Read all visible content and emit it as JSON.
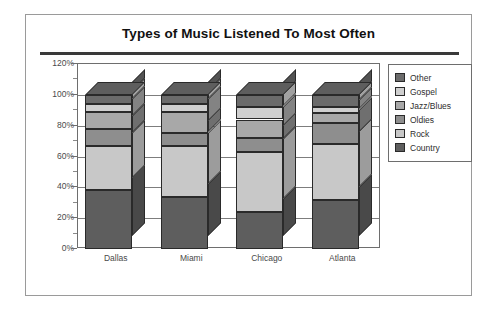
{
  "chart_data": {
    "type": "bar",
    "subtype": "stacked-column-100-3d",
    "title": "Types of Music Listened To Most Often",
    "xlabel": "",
    "ylabel": "",
    "ylim": [
      0,
      120
    ],
    "ytick_labels": [
      "0%",
      "20%",
      "40%",
      "60%",
      "80%",
      "100%",
      "120%"
    ],
    "ytick_values": [
      0,
      20,
      40,
      60,
      80,
      100,
      120
    ],
    "minor_tick_interval": 10,
    "grid": true,
    "legend_position": "right",
    "categories": [
      "Dallas",
      "Miami",
      "Chicago",
      "Atlanta"
    ],
    "series": [
      {
        "name": "Country",
        "color": "#5e5e5e",
        "values": [
          38,
          34,
          24,
          32
        ]
      },
      {
        "name": "Rock",
        "color": "#c8c8c8",
        "values": [
          29,
          33,
          39,
          36
        ]
      },
      {
        "name": "Oldies",
        "color": "#8e8e8e",
        "values": [
          11,
          8,
          9,
          14
        ]
      },
      {
        "name": "Jazz/Blues",
        "color": "#a8a8a8",
        "values": [
          11,
          14,
          12,
          6
        ]
      },
      {
        "name": "Gospel",
        "color": "#cfcfcf",
        "values": [
          5,
          5,
          8,
          4
        ]
      },
      {
        "name": "Other",
        "color": "#6b6b6b",
        "values": [
          6,
          6,
          8,
          8
        ]
      }
    ],
    "legend_order": [
      "Other",
      "Gospel",
      "Jazz/Blues",
      "Oldies",
      "Rock",
      "Country"
    ]
  },
  "colors": {
    "frame": "#9a9a9a",
    "title_rule": "#3a3a3a",
    "axis": "#6e6e6e",
    "gridline": "#7d7d7d",
    "text": "#4a4a4a",
    "bar_outline": "#2a2a2a"
  }
}
